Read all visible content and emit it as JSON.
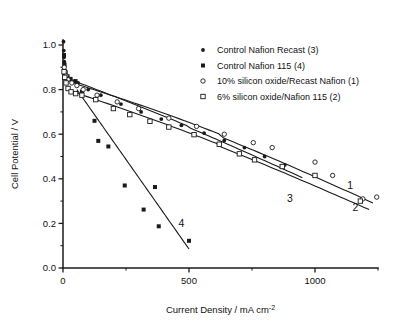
{
  "chart_data": {
    "type": "scatter",
    "title": "",
    "xlabel": "Current Density / mA cm-2",
    "xlabel_main": "Current Density / mA cm",
    "xlabel_sup": "-2",
    "ylabel": "Cell Potential / V",
    "xlim": [
      0,
      1250
    ],
    "ylim": [
      0.0,
      1.05
    ],
    "grid": false,
    "legend_position": "upper-right-inside",
    "xticks": [
      0,
      500,
      1000
    ],
    "xticklabels": [
      "0",
      "500",
      "1000"
    ],
    "xticks_minor": [
      250,
      750,
      1250
    ],
    "yticks": [
      0.0,
      0.2,
      0.4,
      0.6,
      0.8,
      1.0
    ],
    "yticklabels": [
      "0.0",
      "0.2",
      "0.4",
      "0.6",
      "0.8",
      "1.0"
    ],
    "yticks_minor": [
      0.1,
      0.3,
      0.5,
      0.7,
      0.9
    ],
    "curve_labels": [
      {
        "text": "1",
        "x": 1140,
        "y": 0.355
      },
      {
        "text": "2",
        "x": 1160,
        "y": 0.255
      },
      {
        "text": "3",
        "x": 900,
        "y": 0.295
      },
      {
        "text": "4",
        "x": 470,
        "y": 0.185
      }
    ],
    "series": [
      {
        "name": "Control Nafion Recast (3)",
        "curve_number": "3",
        "marker": "filled-circle",
        "points": [
          {
            "x": 2,
            "y": 1.015
          },
          {
            "x": 3,
            "y": 0.975
          },
          {
            "x": 4,
            "y": 0.945
          },
          {
            "x": 5,
            "y": 0.925
          },
          {
            "x": 6,
            "y": 0.905
          },
          {
            "x": 8,
            "y": 0.885
          },
          {
            "x": 10,
            "y": 0.872
          },
          {
            "x": 14,
            "y": 0.862
          },
          {
            "x": 20,
            "y": 0.852
          },
          {
            "x": 30,
            "y": 0.845
          },
          {
            "x": 45,
            "y": 0.838
          },
          {
            "x": 60,
            "y": 0.83
          },
          {
            "x": 100,
            "y": 0.8
          },
          {
            "x": 150,
            "y": 0.775
          },
          {
            "x": 230,
            "y": 0.735
          },
          {
            "x": 310,
            "y": 0.7
          },
          {
            "x": 390,
            "y": 0.668
          },
          {
            "x": 470,
            "y": 0.64
          },
          {
            "x": 560,
            "y": 0.605
          },
          {
            "x": 640,
            "y": 0.572
          },
          {
            "x": 720,
            "y": 0.54
          },
          {
            "x": 800,
            "y": 0.5
          },
          {
            "x": 880,
            "y": 0.462
          }
        ],
        "fit": {
          "x0": 60,
          "y0": 0.832,
          "x1": 950,
          "y1": 0.405,
          "curvature": 0.012
        }
      },
      {
        "name": "Control Nafion 115 (4)",
        "curve_number": "4",
        "marker": "filled-square",
        "points": [
          {
            "x": 4,
            "y": 0.955
          },
          {
            "x": 6,
            "y": 0.912
          },
          {
            "x": 10,
            "y": 0.878
          },
          {
            "x": 18,
            "y": 0.86
          },
          {
            "x": 30,
            "y": 0.848
          },
          {
            "x": 50,
            "y": 0.838
          },
          {
            "x": 75,
            "y": 0.79
          },
          {
            "x": 125,
            "y": 0.66
          },
          {
            "x": 140,
            "y": 0.57
          },
          {
            "x": 180,
            "y": 0.545
          },
          {
            "x": 245,
            "y": 0.37
          },
          {
            "x": 320,
            "y": 0.262
          },
          {
            "x": 365,
            "y": 0.363
          },
          {
            "x": 380,
            "y": 0.187
          },
          {
            "x": 500,
            "y": 0.122
          }
        ],
        "fit": {
          "x0": 55,
          "y0": 0.8,
          "x1": 500,
          "y1": 0.085,
          "curvature": 0.0
        }
      },
      {
        "name": "10% silicon oxide/Recast Nafion (1)",
        "curve_number": "1",
        "marker": "open-circle",
        "points": [
          {
            "x": 5,
            "y": 0.9
          },
          {
            "x": 8,
            "y": 0.88
          },
          {
            "x": 12,
            "y": 0.862
          },
          {
            "x": 20,
            "y": 0.845
          },
          {
            "x": 35,
            "y": 0.83
          },
          {
            "x": 55,
            "y": 0.818
          },
          {
            "x": 80,
            "y": 0.8
          },
          {
            "x": 135,
            "y": 0.775
          },
          {
            "x": 215,
            "y": 0.745
          },
          {
            "x": 300,
            "y": 0.715
          },
          {
            "x": 420,
            "y": 0.672
          },
          {
            "x": 530,
            "y": 0.635
          },
          {
            "x": 640,
            "y": 0.6
          },
          {
            "x": 755,
            "y": 0.562
          },
          {
            "x": 830,
            "y": 0.54
          },
          {
            "x": 1000,
            "y": 0.475
          },
          {
            "x": 1070,
            "y": 0.415
          },
          {
            "x": 1190,
            "y": 0.31
          },
          {
            "x": 1245,
            "y": 0.318
          }
        ],
        "fit": {
          "x0": 45,
          "y0": 0.828,
          "x1": 1230,
          "y1": 0.292,
          "curvature": 0.03
        }
      },
      {
        "name": "6% silicon oxide/Nafion 115 (2)",
        "curve_number": "2",
        "marker": "open-square",
        "points": [
          {
            "x": 4,
            "y": 0.88
          },
          {
            "x": 7,
            "y": 0.855
          },
          {
            "x": 12,
            "y": 0.83
          },
          {
            "x": 20,
            "y": 0.805
          },
          {
            "x": 32,
            "y": 0.79
          },
          {
            "x": 50,
            "y": 0.782
          },
          {
            "x": 75,
            "y": 0.775
          },
          {
            "x": 130,
            "y": 0.755
          },
          {
            "x": 200,
            "y": 0.715
          },
          {
            "x": 265,
            "y": 0.688
          },
          {
            "x": 345,
            "y": 0.658
          },
          {
            "x": 420,
            "y": 0.632
          },
          {
            "x": 520,
            "y": 0.598
          },
          {
            "x": 620,
            "y": 0.555
          },
          {
            "x": 700,
            "y": 0.512
          },
          {
            "x": 760,
            "y": 0.485
          },
          {
            "x": 870,
            "y": 0.455
          },
          {
            "x": 1000,
            "y": 0.415
          },
          {
            "x": 1180,
            "y": 0.3
          }
        ],
        "fit": {
          "x0": 40,
          "y0": 0.79,
          "x1": 1215,
          "y1": 0.262,
          "curvature": 0.022
        }
      }
    ],
    "legend_entries": [
      {
        "label": "Control Nafion Recast (3)",
        "marker": "filled-circle"
      },
      {
        "label": "Control Nafion 115 (4)",
        "marker": "filled-square"
      },
      {
        "label": "10% silicon oxide/Recast Nafion (1)",
        "marker": "open-circle"
      },
      {
        "label": "6% silicon oxide/Nafion 115 (2)",
        "marker": "open-square"
      }
    ]
  },
  "colors": {
    "ink": "#1a1a1a",
    "background": "#ffffff"
  }
}
